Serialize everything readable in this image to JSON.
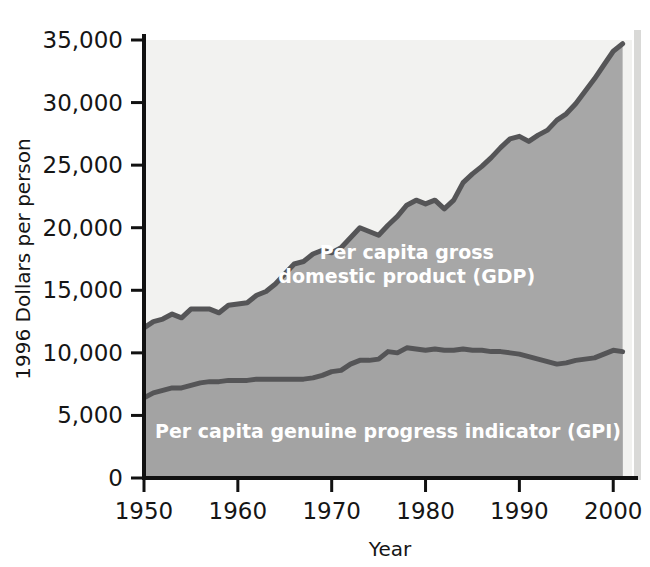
{
  "chart_data": {
    "type": "area",
    "title": "",
    "xlabel": "Year",
    "ylabel": "1996 Dollars per person",
    "xlim": [
      1950,
      2002
    ],
    "ylim": [
      0,
      35000
    ],
    "xticks": [
      "1950",
      "1960",
      "1970",
      "1980",
      "1990",
      "2000"
    ],
    "xtick_values": [
      1950,
      1960,
      1970,
      1980,
      1990,
      2000
    ],
    "yticks": [
      "0",
      "5,000",
      "10,000",
      "15,000",
      "20,000",
      "25,000",
      "30,000",
      "35,000"
    ],
    "ytick_values": [
      0,
      5000,
      10000,
      15000,
      20000,
      25000,
      30000,
      35000
    ],
    "grid": false,
    "legend_position": "inline-annotation",
    "x": [
      1950,
      1951,
      1952,
      1953,
      1954,
      1955,
      1956,
      1957,
      1958,
      1959,
      1960,
      1961,
      1962,
      1963,
      1964,
      1965,
      1966,
      1967,
      1968,
      1969,
      1970,
      1971,
      1972,
      1973,
      1974,
      1975,
      1976,
      1977,
      1978,
      1979,
      1980,
      1981,
      1982,
      1983,
      1984,
      1985,
      1986,
      1987,
      1988,
      1989,
      1990,
      1991,
      1992,
      1993,
      1994,
      1995,
      1996,
      1997,
      1998,
      1999,
      2000,
      2001
    ],
    "series": [
      {
        "name": "Per capita gross domestic product (GDP)",
        "color": "#a7a7a7",
        "values": [
          12000,
          12500,
          12700,
          13100,
          12800,
          13500,
          13500,
          13500,
          13200,
          13800,
          13900,
          14000,
          14600,
          14900,
          15500,
          16300,
          17100,
          17300,
          17900,
          18200,
          18000,
          18400,
          19200,
          20000,
          19700,
          19400,
          20200,
          20900,
          21800,
          22200,
          21900,
          22200,
          21500,
          22200,
          23600,
          24300,
          24900,
          25600,
          26400,
          27100,
          27300,
          26900,
          27400,
          27800,
          28600,
          29100,
          29900,
          30900,
          31900,
          33000,
          34100,
          34700
        ]
      },
      {
        "name": "Per capita genuine progress indicator (GPI)",
        "color": "#a7a7a7",
        "values": [
          6400,
          6800,
          7000,
          7200,
          7200,
          7400,
          7600,
          7700,
          7700,
          7800,
          7800,
          7800,
          7900,
          7900,
          7900,
          7900,
          7900,
          7900,
          8000,
          8200,
          8500,
          8600,
          9100,
          9400,
          9400,
          9500,
          10100,
          10000,
          10400,
          10300,
          10200,
          10300,
          10200,
          10200,
          10300,
          10200,
          10200,
          10100,
          10100,
          10000,
          9900,
          9700,
          9500,
          9300,
          9100,
          9200,
          9400,
          9500,
          9600,
          9900,
          10200,
          10100
        ]
      }
    ],
    "annotations": [
      {
        "name": "gdp-label",
        "lines": [
          "Per capita gross",
          "domestic product (GDP)"
        ],
        "x": 1978,
        "y": 17500
      },
      {
        "name": "gpi-label",
        "lines": [
          "Per capita genuine progress indicator (GPI)"
        ],
        "x": 1976,
        "y": 3200
      }
    ],
    "colors": {
      "band_upper_background": "#f2f2f0",
      "gdp_band_fill": "#a7a7a7",
      "gpi_band_fill": "#a3a3a3",
      "curve_stroke": "#555557",
      "axis": "#111111",
      "label_text": "#ffffff",
      "tick_text": "#151515"
    }
  },
  "axes": {
    "y_title": "1996 Dollars per person",
    "x_title": "Year"
  }
}
